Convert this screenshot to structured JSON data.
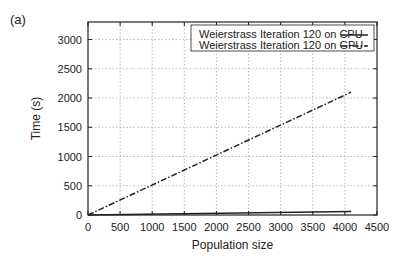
{
  "panel_label": "(a)",
  "chart_data": {
    "type": "line",
    "title": "",
    "xlabel": "Population size",
    "ylabel": "Time (s)",
    "xlim": [
      0,
      4500
    ],
    "ylim": [
      0,
      3300
    ],
    "xticks": [
      0,
      500,
      1000,
      1500,
      2000,
      2500,
      3000,
      3500,
      4000,
      4500
    ],
    "yticks": [
      0,
      500,
      1000,
      1500,
      2000,
      2500,
      3000
    ],
    "grid": true,
    "legend_position": "upper right",
    "series": [
      {
        "name": "Weierstrass Iteration 120 on CPU",
        "style": "solid",
        "x": [
          0,
          4096
        ],
        "y": [
          0,
          60
        ]
      },
      {
        "name": "Weierstrass Iteration 120 on GPU",
        "style": "dash-dot",
        "x": [
          0,
          4096
        ],
        "y": [
          0,
          2100
        ]
      }
    ]
  }
}
